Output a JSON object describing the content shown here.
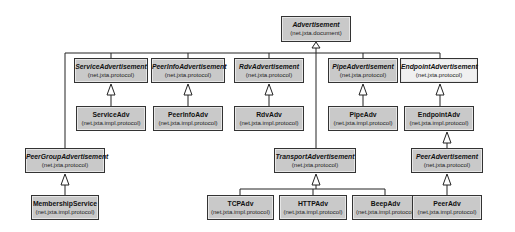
{
  "diagram": {
    "type": "uml-class-hierarchy",
    "nodes": [
      {
        "id": "advertisement",
        "name": "Advertisement",
        "package": "(net.jxta.document)",
        "abstract": true,
        "x": 281,
        "y": 16,
        "w": 70,
        "h": 26
      },
      {
        "id": "service-advertisement",
        "name": "ServiceAdvertisement",
        "package": "(net.jxta.protocol)",
        "abstract": true,
        "x": 74,
        "y": 58,
        "w": 74,
        "h": 25
      },
      {
        "id": "peerinfo-advertisement",
        "name": "PeerInfoAdvertisement",
        "package": "(net.jxta.protocol)",
        "abstract": true,
        "x": 151,
        "y": 58,
        "w": 74,
        "h": 25
      },
      {
        "id": "rdv-advertisement",
        "name": "RdvAdvertisement",
        "package": "(net.jxta.protocol)",
        "abstract": true,
        "x": 234,
        "y": 58,
        "w": 70,
        "h": 25
      },
      {
        "id": "pipe-advertisement",
        "name": "PipeAdvertisement",
        "package": "(net.jxta.protocol)",
        "abstract": true,
        "x": 328,
        "y": 58,
        "w": 70,
        "h": 25
      },
      {
        "id": "endpoint-advertisement",
        "name": "EndpointAdvertisement",
        "package": "(net.jxta.protocol)",
        "abstract": true,
        "light": true,
        "x": 400,
        "y": 58,
        "w": 78,
        "h": 25
      },
      {
        "id": "service-adv",
        "name": "ServiceAdv",
        "package": "(net.jxta.impl.protocol)",
        "abstract": false,
        "x": 76,
        "y": 106,
        "w": 70,
        "h": 25
      },
      {
        "id": "peerinfo-adv",
        "name": "PeerInfoAdv",
        "package": "(net.jxta.impl.protocol)",
        "abstract": false,
        "x": 153,
        "y": 106,
        "w": 70,
        "h": 25
      },
      {
        "id": "rdv-adv",
        "name": "RdvAdv",
        "package": "(net.jxta.impl.protocol)",
        "abstract": false,
        "x": 234,
        "y": 106,
        "w": 70,
        "h": 25
      },
      {
        "id": "pipe-adv",
        "name": "PipeAdv",
        "package": "(net.jxta.impl.protocol)",
        "abstract": false,
        "x": 328,
        "y": 106,
        "w": 70,
        "h": 25
      },
      {
        "id": "endpoint-adv",
        "name": "EndpointAdv",
        "package": "(net.jxta.impl.protocol)",
        "abstract": false,
        "x": 404,
        "y": 106,
        "w": 70,
        "h": 25
      },
      {
        "id": "peergroup-advertisement",
        "name": "PeerGroupAdvertisement",
        "package": "(net.jxta.protocol)",
        "abstract": true,
        "x": 25,
        "y": 148,
        "w": 80,
        "h": 25
      },
      {
        "id": "transport-advertisement",
        "name": "TransportAdvertisement",
        "package": "(net.jxta.protocol)",
        "abstract": true,
        "x": 274,
        "y": 148,
        "w": 82,
        "h": 25
      },
      {
        "id": "peer-advertisement",
        "name": "PeerAdvertisement",
        "package": "(net.jxta.protocol)",
        "abstract": true,
        "x": 411,
        "y": 148,
        "w": 72,
        "h": 25
      },
      {
        "id": "membership-service",
        "name": "MembershipService",
        "package": "(net.jxta.impl.protocol)",
        "abstract": false,
        "x": 31,
        "y": 195,
        "w": 68,
        "h": 25
      },
      {
        "id": "tcp-adv",
        "name": "TCPAdv",
        "package": "(net.jxta.impl.protocol)",
        "abstract": false,
        "x": 207,
        "y": 195,
        "w": 67,
        "h": 25
      },
      {
        "id": "http-adv",
        "name": "HTTPAdv",
        "package": "(net.jxta.impl.protocol)",
        "abstract": false,
        "x": 279,
        "y": 195,
        "w": 68,
        "h": 25
      },
      {
        "id": "beep-adv",
        "name": "BeepAdv",
        "package": "(net.jxta.impl.protocol)",
        "abstract": false,
        "x": 352,
        "y": 195,
        "w": 67,
        "h": 25
      },
      {
        "id": "peer-adv",
        "name": "PeerAdv",
        "package": "(net.jxta.impl.protocol)",
        "abstract": false,
        "x": 412,
        "y": 195,
        "w": 70,
        "h": 25
      }
    ],
    "edges": [
      {
        "from": "service-advertisement",
        "to": "advertisement"
      },
      {
        "from": "peerinfo-advertisement",
        "to": "advertisement"
      },
      {
        "from": "rdv-advertisement",
        "to": "advertisement"
      },
      {
        "from": "pipe-advertisement",
        "to": "advertisement"
      },
      {
        "from": "endpoint-advertisement",
        "to": "advertisement"
      },
      {
        "from": "peergroup-advertisement",
        "to": "advertisement"
      },
      {
        "from": "transport-advertisement",
        "to": "advertisement"
      },
      {
        "from": "service-adv",
        "to": "service-advertisement"
      },
      {
        "from": "peerinfo-adv",
        "to": "peerinfo-advertisement"
      },
      {
        "from": "rdv-adv",
        "to": "rdv-advertisement"
      },
      {
        "from": "pipe-adv",
        "to": "pipe-advertisement"
      },
      {
        "from": "endpoint-adv",
        "to": "endpoint-advertisement"
      },
      {
        "from": "peer-advertisement",
        "to": "endpoint-adv"
      },
      {
        "from": "peer-adv",
        "to": "peer-advertisement"
      },
      {
        "from": "membership-service",
        "to": "peergroup-advertisement"
      },
      {
        "from": "tcp-adv",
        "to": "transport-advertisement"
      },
      {
        "from": "http-adv",
        "to": "transport-advertisement"
      },
      {
        "from": "beep-adv",
        "to": "transport-advertisement"
      }
    ]
  }
}
